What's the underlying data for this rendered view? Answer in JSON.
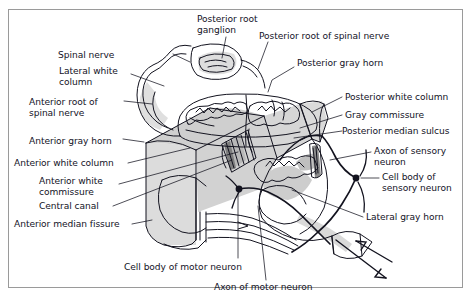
{
  "figure": {
    "kind": "anatomical-line-diagram",
    "border_color": "#9a9a9a",
    "background_color": "#ffffff",
    "ink_color": "#13131f",
    "shading_color": "#d4d4d4"
  },
  "labels": [
    {
      "id": "posterior-root-ganglion",
      "text": "Posterior root\nganglion",
      "x": 197,
      "y": 14,
      "align": "left"
    },
    {
      "id": "posterior-root-spinal-nerve",
      "text": "Posterior root of spinal nerve",
      "x": 259,
      "y": 31,
      "align": "left"
    },
    {
      "id": "posterior-gray-horn",
      "text": "Posterior gray horn",
      "x": 297,
      "y": 58,
      "align": "left"
    },
    {
      "id": "spinal-nerve",
      "text": "Spinal nerve",
      "x": 118,
      "y": 50,
      "align": "left"
    },
    {
      "id": "lateral-white-column",
      "text": "Lateral white\ncolumn",
      "x": 59,
      "y": 66,
      "align": "left"
    },
    {
      "id": "anterior-root-spinal-nerve",
      "text": "Anterior root of\nspinal nerve",
      "x": 29,
      "y": 97,
      "align": "left"
    },
    {
      "id": "anterior-gray-horn",
      "text": "Anterior gray horn",
      "x": 29,
      "y": 136,
      "align": "left"
    },
    {
      "id": "anterior-white-column",
      "text": "Anterior white column",
      "x": 14,
      "y": 160,
      "align": "left"
    },
    {
      "id": "anterior-white-commissure",
      "text": "Anterior white\ncommissure",
      "x": 39,
      "y": 176,
      "align": "left"
    },
    {
      "id": "central-canal",
      "text": "Central canal",
      "x": 39,
      "y": 203,
      "align": "left"
    },
    {
      "id": "anterior-median-fissure",
      "text": "Anterior median fissure",
      "x": 14,
      "y": 221,
      "align": "left"
    },
    {
      "id": "posterior-white-column",
      "text": "Posterior white column",
      "x": 345,
      "y": 94,
      "align": "left"
    },
    {
      "id": "gray-commissure",
      "text": "Gray commissure",
      "x": 345,
      "y": 112,
      "align": "left"
    },
    {
      "id": "posterior-median-sulcus",
      "text": "Posterior median sulcus",
      "x": 345,
      "y": 128,
      "align": "left"
    },
    {
      "id": "axon-of-sensory-neuron",
      "text": "Axon of sensory\nneuron",
      "x": 374,
      "y": 146,
      "align": "left"
    },
    {
      "id": "cell-body-of-sensory-neuron",
      "text": "Cell body of\nsensory neuron",
      "x": 382,
      "y": 175,
      "align": "left"
    },
    {
      "id": "lateral-gray-horn",
      "text": "Lateral gray horn",
      "x": 366,
      "y": 214,
      "align": "left"
    },
    {
      "id": "cell-body-of-motor-neuron",
      "text": "Cell body of motor neuron",
      "x": 124,
      "y": 262,
      "align": "left"
    },
    {
      "id": "axon-of-motor-neuron",
      "text": "Axon of motor neuron",
      "x": 214,
      "y": 284,
      "align": "left"
    }
  ]
}
